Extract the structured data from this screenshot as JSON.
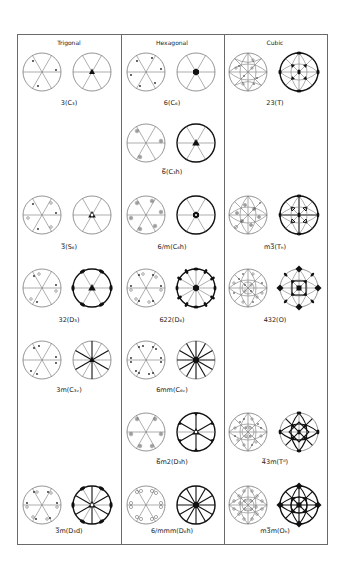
{
  "figure": {
    "type": "stereographic projections of crystallographic point groups",
    "columns": [
      {
        "header": "Trigonal"
      },
      {
        "header": "Hexagonal"
      },
      {
        "header": "Cubic"
      }
    ],
    "groups": {
      "trigonal": [
        {
          "label": "3(C₃)"
        },
        {
          "label": "3̅(S₆)"
        },
        {
          "label": "32(D₃)"
        },
        {
          "label": "3m(C₃ᵥ)"
        },
        {
          "label": "3̅m(D₃d)"
        }
      ],
      "hexagonal": [
        {
          "label": "6(C₆)"
        },
        {
          "label": "6̅(C₃h)"
        },
        {
          "label": "6/m(C₆h)"
        },
        {
          "label": "622(D₆)"
        },
        {
          "label": "6mm(C₆ᵥ)"
        },
        {
          "label": "6̅m2(D₃h)"
        },
        {
          "label": "6/mmm(D₆h)"
        }
      ],
      "cubic": [
        {
          "label": "23(T)"
        },
        {
          "label": "m3̅(Tₕ)"
        },
        {
          "label": "432(O)"
        },
        {
          "label": "4̅3m(Tᵈ)"
        },
        {
          "label": "m3̅m(Oₕ)"
        }
      ]
    },
    "panel_types": [
      "general-positions",
      "symmetry-elements"
    ]
  }
}
